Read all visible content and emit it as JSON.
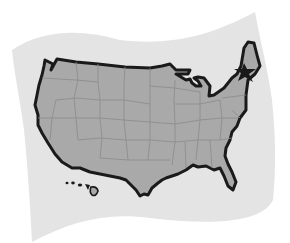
{
  "map": {
    "title": "United States map",
    "region": "Contiguous United States with Hawaii",
    "marker": {
      "type": "star",
      "location": "Northeast (New England coast)"
    },
    "colors": {
      "background": "#ffffff",
      "paper": "#e4e4e4",
      "land": "#a9a9a9",
      "state_borders": "#8a8a8a",
      "outline": "#1a1a1a",
      "star": "#1a1a1a"
    },
    "features": [
      "paper-sheet",
      "us-outline",
      "state-borders",
      "great-lakes",
      "florida",
      "hawaii-islands",
      "star-marker"
    ]
  }
}
